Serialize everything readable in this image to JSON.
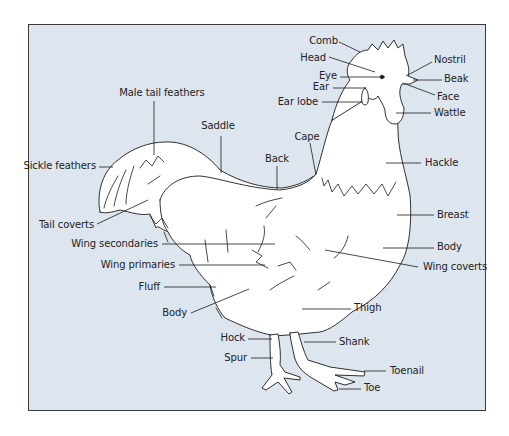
{
  "diagram": {
    "background_color": "#dde6ef",
    "line_color": "#1a1a1a",
    "labels": [
      {
        "id": "comb",
        "text": "Comb",
        "x": 338,
        "y": 35,
        "align": "r",
        "line": [
          [
            339,
            42
          ],
          [
            360,
            52
          ]
        ]
      },
      {
        "id": "head",
        "text": "Head",
        "x": 326,
        "y": 52,
        "align": "r",
        "line": [
          [
            329,
            57
          ],
          [
            375,
            72
          ]
        ]
      },
      {
        "id": "eye",
        "text": "Eye",
        "x": 337,
        "y": 70,
        "align": "r",
        "line": [
          [
            340,
            77
          ],
          [
            385,
            77
          ]
        ]
      },
      {
        "id": "ear",
        "text": "Ear",
        "x": 329,
        "y": 81,
        "align": "r",
        "line": [
          [
            333,
            88
          ],
          [
            366,
            88
          ]
        ]
      },
      {
        "id": "ear-lobe",
        "text": "Ear lobe",
        "x": 318,
        "y": 96,
        "align": "r",
        "line": [
          [
            322,
            102
          ],
          [
            362,
            102
          ]
        ]
      },
      {
        "id": "nostril",
        "text": "Nostril",
        "x": 434,
        "y": 54,
        "align": "l",
        "line": [
          [
            432,
            62
          ],
          [
            406,
            76
          ]
        ]
      },
      {
        "id": "beak",
        "text": "Beak",
        "x": 444,
        "y": 73,
        "align": "l",
        "line": [
          [
            442,
            80
          ],
          [
            413,
            80
          ]
        ]
      },
      {
        "id": "face",
        "text": "Face",
        "x": 437,
        "y": 91,
        "align": "l",
        "line": [
          [
            435,
            95
          ],
          [
            403,
            83
          ]
        ]
      },
      {
        "id": "wattle",
        "text": "Wattle",
        "x": 434,
        "y": 107,
        "align": "l",
        "line": [
          [
            431,
            113
          ],
          [
            396,
            113
          ]
        ]
      },
      {
        "id": "male-tail-feathers",
        "text": "Male tail feathers",
        "x": 162,
        "y": 87,
        "align": "c",
        "line": [
          [
            154,
            101
          ],
          [
            154,
            155
          ]
        ]
      },
      {
        "id": "saddle",
        "text": "Saddle",
        "x": 218,
        "y": 120,
        "align": "c",
        "line": [
          [
            221,
            136
          ],
          [
            221,
            173
          ]
        ]
      },
      {
        "id": "cape",
        "text": "Cape",
        "x": 307,
        "y": 131,
        "align": "c",
        "line": [
          [
            310,
            143
          ],
          [
            316,
            175
          ]
        ]
      },
      {
        "id": "back",
        "text": "Back",
        "x": 277,
        "y": 153,
        "align": "c",
        "line": [
          [
            277,
            166
          ],
          [
            277,
            189
          ]
        ]
      },
      {
        "id": "sickle-feathers",
        "text": "Sickle feathers",
        "x": 96,
        "y": 160,
        "align": "r",
        "line": [
          [
            99,
            167
          ],
          [
            113,
            167
          ]
        ]
      },
      {
        "id": "hackle",
        "text": "Hackle",
        "x": 425,
        "y": 157,
        "align": "l",
        "line": [
          [
            421,
            163
          ],
          [
            386,
            163
          ]
        ]
      },
      {
        "id": "tail-coverts",
        "text": "Tail coverts",
        "x": 94,
        "y": 219,
        "align": "r",
        "line": [
          [
            97,
            224
          ],
          [
            148,
            200
          ]
        ]
      },
      {
        "id": "breast",
        "text": "Breast",
        "x": 437,
        "y": 209,
        "align": "l",
        "line": [
          [
            434,
            215
          ],
          [
            397,
            215
          ]
        ]
      },
      {
        "id": "wing-secondaries",
        "text": "Wing secondaries",
        "x": 158,
        "y": 238,
        "align": "r",
        "line": [
          [
            162,
            244
          ],
          [
            275,
            244
          ]
        ]
      },
      {
        "id": "body-right",
        "text": "Body",
        "x": 437,
        "y": 241,
        "align": "l",
        "line": [
          [
            434,
            248
          ],
          [
            383,
            248
          ]
        ]
      },
      {
        "id": "wing-primaries",
        "text": "Wing primaries",
        "x": 175,
        "y": 259,
        "align": "r",
        "line": [
          [
            179,
            265
          ],
          [
            265,
            265
          ]
        ]
      },
      {
        "id": "wing-coverts",
        "text": "Wing coverts",
        "x": 423,
        "y": 261,
        "align": "l",
        "line": [
          [
            418,
            267
          ],
          [
            325,
            250
          ]
        ]
      },
      {
        "id": "fluff",
        "text": "Fluff",
        "x": 160,
        "y": 281,
        "align": "r",
        "line": [
          [
            164,
            287
          ],
          [
            216,
            287
          ]
        ]
      },
      {
        "id": "body-left",
        "text": "Body",
        "x": 187,
        "y": 307,
        "align": "r",
        "line": [
          [
            191,
            313
          ],
          [
            249,
            289
          ]
        ]
      },
      {
        "id": "thigh",
        "text": "Thigh",
        "x": 354,
        "y": 302,
        "align": "l",
        "line": [
          [
            351,
            309
          ],
          [
            302,
            309
          ]
        ]
      },
      {
        "id": "hock",
        "text": "Hock",
        "x": 245,
        "y": 332,
        "align": "r",
        "line": [
          [
            248,
            339
          ],
          [
            272,
            339
          ]
        ]
      },
      {
        "id": "shank",
        "text": "Shank",
        "x": 339,
        "y": 336,
        "align": "l",
        "line": [
          [
            336,
            342
          ],
          [
            304,
            342
          ]
        ]
      },
      {
        "id": "spur",
        "text": "Spur",
        "x": 247,
        "y": 352,
        "align": "r",
        "line": [
          [
            251,
            358
          ],
          [
            273,
            358
          ]
        ]
      },
      {
        "id": "toenail",
        "text": "Toenail",
        "x": 390,
        "y": 365,
        "align": "l",
        "line": [
          [
            386,
            371
          ],
          [
            364,
            371
          ]
        ]
      },
      {
        "id": "toe",
        "text": "Toe",
        "x": 364,
        "y": 382,
        "align": "l",
        "line": [
          [
            361,
            389
          ],
          [
            339,
            389
          ]
        ]
      }
    ]
  }
}
